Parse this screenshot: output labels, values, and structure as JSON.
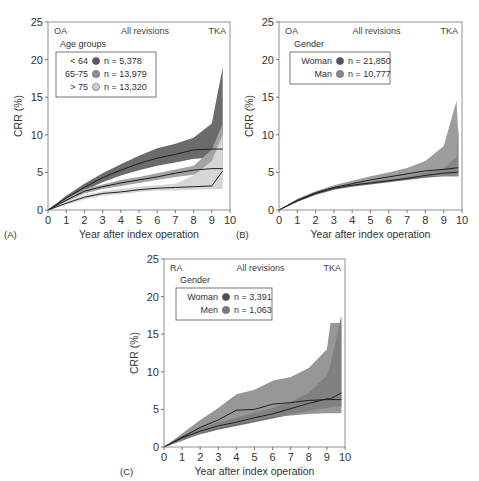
{
  "chart_data": [
    {
      "id": "A",
      "type": "line",
      "panel_label": "(A)",
      "header_left": "OA",
      "header_center": "All revisions",
      "header_right": "TKA",
      "legend_title": "Age groups",
      "xlabel": "Year after index operation",
      "ylabel": "CRR (%)",
      "xlim": [
        0,
        10
      ],
      "ylim": [
        0,
        25
      ],
      "xticks": [
        "0",
        "1",
        "2",
        "3",
        "4",
        "5",
        "6",
        "7",
        "8",
        "9",
        "10"
      ],
      "yticks": [
        "0",
        "5",
        "10",
        "15",
        "20",
        "25"
      ],
      "grid": false,
      "x": [
        0,
        1,
        2,
        3,
        4,
        5,
        6,
        7,
        8,
        9,
        9.6
      ],
      "series": [
        {
          "name": "< 64",
          "n_label": "n =   5,378",
          "color": "#5a5a5a",
          "band_color": "#6b6b6b",
          "values": [
            0,
            1.6,
            3.0,
            4.3,
            5.3,
            6.2,
            6.9,
            7.4,
            8.0,
            8.1,
            8.1
          ],
          "lower": [
            0,
            1.3,
            2.6,
            3.7,
            4.6,
            5.3,
            5.9,
            6.3,
            6.8,
            6.9,
            6.9
          ],
          "upper": [
            0,
            1.9,
            3.5,
            4.9,
            6.1,
            7.2,
            8.2,
            8.8,
            9.6,
            11.5,
            19.0
          ]
        },
        {
          "name": "65-75",
          "n_label": "n = 13,979",
          "color": "#8f8f8f",
          "band_color": "#a3a3a3",
          "values": [
            0,
            1.3,
            2.5,
            3.1,
            3.6,
            4.0,
            4.4,
            4.9,
            5.3,
            5.5,
            5.5
          ],
          "lower": [
            0,
            1.1,
            2.2,
            2.8,
            3.2,
            3.6,
            4.0,
            4.4,
            4.7,
            4.9,
            4.9
          ],
          "upper": [
            0,
            1.5,
            2.8,
            3.4,
            4.0,
            4.4,
            4.9,
            5.4,
            5.9,
            8.0,
            11.5
          ]
        },
        {
          "name": "> 75",
          "n_label": "n = 13,320",
          "color": "#cfcfcf",
          "band_color": "#d6d6d6",
          "values": [
            0,
            0.9,
            1.7,
            2.2,
            2.4,
            2.7,
            2.9,
            3.0,
            3.1,
            3.2,
            5.2
          ],
          "lower": [
            0,
            0.7,
            1.4,
            1.9,
            2.1,
            2.4,
            2.6,
            2.6,
            2.7,
            2.8,
            2.8
          ],
          "upper": [
            0,
            1.1,
            2.0,
            2.5,
            2.8,
            3.1,
            3.3,
            3.5,
            4.6,
            6.5,
            10.0
          ]
        }
      ]
    },
    {
      "id": "B",
      "type": "line",
      "panel_label": "(B)",
      "header_left": "OA",
      "header_center": "All revisions",
      "header_right": "TKA",
      "legend_title": "Gender",
      "xlabel": "Year after index operation",
      "ylabel": "CRR (%)",
      "xlim": [
        0,
        10
      ],
      "ylim": [
        0,
        25
      ],
      "xticks": [
        "0",
        "1",
        "2",
        "3",
        "4",
        "5",
        "6",
        "7",
        "8",
        "9",
        "10"
      ],
      "yticks": [
        "0",
        "5",
        "10",
        "15",
        "20",
        "25"
      ],
      "grid": false,
      "x": [
        0,
        1,
        2,
        3,
        4,
        5,
        6,
        7,
        8,
        9,
        9.7,
        9.8
      ],
      "series": [
        {
          "name": "Woman",
          "n_label": "n = 21,850",
          "color": "#555555",
          "band_color": "#555555",
          "values": [
            0,
            1.2,
            2.2,
            2.9,
            3.3,
            3.6,
            3.9,
            4.2,
            4.6,
            4.9,
            5.0,
            5.1
          ],
          "lower": [
            0,
            1.1,
            2.0,
            2.7,
            3.1,
            3.4,
            3.7,
            4.0,
            4.3,
            4.5,
            4.5,
            4.5
          ],
          "upper": [
            0,
            1.3,
            2.3,
            3.0,
            3.4,
            3.8,
            4.1,
            4.5,
            5.0,
            5.6,
            7.0,
            11.0
          ]
        },
        {
          "name": "Man",
          "n_label": "n = 10,777",
          "color": "#8a8a8a",
          "band_color": "#8c8c8c",
          "values": [
            0,
            1.3,
            2.3,
            3.0,
            3.5,
            4.0,
            4.4,
            4.8,
            5.2,
            5.4,
            5.6,
            5.6
          ],
          "lower": [
            0,
            1.1,
            2.1,
            2.8,
            3.2,
            3.6,
            3.9,
            4.2,
            4.5,
            4.5,
            4.5,
            4.5
          ],
          "upper": [
            0,
            1.5,
            2.5,
            3.3,
            3.9,
            4.5,
            5.0,
            5.6,
            6.5,
            8.5,
            14.5,
            10.0
          ]
        }
      ]
    },
    {
      "id": "C",
      "type": "line",
      "panel_label": "(C)",
      "header_left": "RA",
      "header_center": "All revisions",
      "header_right": "TKA",
      "legend_title": "Gender",
      "xlabel": "Year after index operation",
      "ylabel": "CRR (%)",
      "xlim": [
        0,
        10
      ],
      "ylim": [
        0,
        25
      ],
      "xticks": [
        "0",
        "1",
        "2",
        "3",
        "4",
        "5",
        "6",
        "7",
        "8",
        "9",
        "10"
      ],
      "yticks": [
        "0",
        "5",
        "10",
        "15",
        "20",
        "25"
      ],
      "grid": false,
      "x": [
        0,
        1,
        2,
        3,
        4,
        5,
        6,
        7,
        8,
        9,
        9.2,
        9.8
      ],
      "series": [
        {
          "name": "Woman",
          "n_label": "n = 3,391",
          "color": "#4d4d4d",
          "band_color": "#555555",
          "values": [
            0,
            1.2,
            2.1,
            2.8,
            3.3,
            3.9,
            4.4,
            5.1,
            5.8,
            6.4,
            6.4,
            7.2
          ],
          "lower": [
            0,
            0.9,
            1.7,
            2.3,
            2.8,
            3.3,
            3.8,
            4.3,
            4.8,
            5.2,
            5.3,
            5.4
          ],
          "upper": [
            0,
            1.5,
            2.5,
            3.3,
            3.9,
            4.6,
            5.2,
            6.0,
            7.2,
            9.5,
            11.0,
            17.5
          ]
        },
        {
          "name": "Men",
          "n_label": "n = 1,063",
          "color": "#7a7a7a",
          "band_color": "#858585",
          "values": [
            0,
            1.3,
            2.6,
            3.6,
            4.9,
            5.0,
            5.7,
            5.9,
            6.2,
            6.3,
            6.3,
            6.3
          ],
          "lower": [
            0,
            0.8,
            1.8,
            2.5,
            3.1,
            3.5,
            4.0,
            4.2,
            4.4,
            4.5,
            4.5,
            4.5
          ],
          "upper": [
            0,
            1.8,
            3.6,
            5.2,
            7.0,
            7.6,
            8.8,
            9.3,
            10.5,
            13.0,
            16.5,
            16.5
          ]
        }
      ]
    }
  ]
}
